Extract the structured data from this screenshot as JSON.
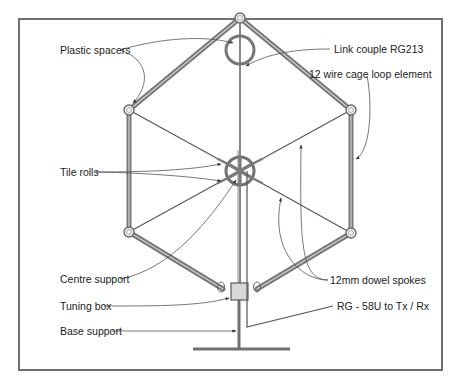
{
  "figure": {
    "labels": {
      "plastic_spacers": "Plastic spacers",
      "link_couple": "Link couple RG213",
      "cage_loop": "12 wire cage loop element",
      "tile_rolls": "Tile rolls",
      "centre_support": "Centre support",
      "dowel_spokes": "12mm dowel spokes",
      "tuning_box": "Tuning box",
      "coax_feed": "RG - 58U to Tx / Rx",
      "base_support": "Base support"
    },
    "colors": {
      "frame": "#6f6f6f",
      "cage": "#777777",
      "text": "#222222",
      "background": "#ffffff"
    }
  }
}
